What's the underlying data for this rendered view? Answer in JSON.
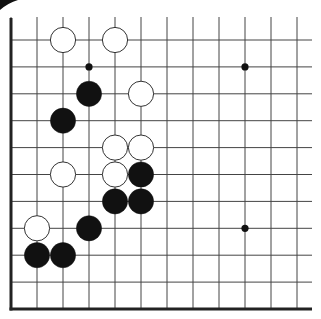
{
  "board": {
    "type": "go-board-fragment",
    "description": "Lower-left corner section of a Go board",
    "edges": [
      "left",
      "bottom"
    ],
    "columns": 12,
    "rows": 11,
    "colors": {
      "background": "#ffffff",
      "line": "#444444",
      "edge": "#222222",
      "black_stone": "#111111",
      "white_stone": "#ffffff",
      "white_stone_outline": "#333333",
      "star_point": "#111111"
    },
    "star_points": [
      {
        "col": 3,
        "row": 1
      },
      {
        "col": 9,
        "row": 1
      },
      {
        "col": 9,
        "row": 7
      }
    ],
    "stones": [
      {
        "color": "white",
        "col": 2,
        "row": 0
      },
      {
        "color": "white",
        "col": 4,
        "row": 0
      },
      {
        "color": "black",
        "col": 3,
        "row": 2
      },
      {
        "color": "white",
        "col": 5,
        "row": 2
      },
      {
        "color": "black",
        "col": 2,
        "row": 3
      },
      {
        "color": "white",
        "col": 4,
        "row": 4
      },
      {
        "color": "white",
        "col": 5,
        "row": 4
      },
      {
        "color": "white",
        "col": 2,
        "row": 5
      },
      {
        "color": "white",
        "col": 4,
        "row": 5
      },
      {
        "color": "black",
        "col": 5,
        "row": 5
      },
      {
        "color": "black",
        "col": 4,
        "row": 6
      },
      {
        "color": "black",
        "col": 5,
        "row": 6
      },
      {
        "color": "white",
        "col": 1,
        "row": 7
      },
      {
        "color": "black",
        "col": 3,
        "row": 7
      },
      {
        "color": "black",
        "col": 1,
        "row": 8
      },
      {
        "color": "black",
        "col": 2,
        "row": 8
      }
    ]
  }
}
